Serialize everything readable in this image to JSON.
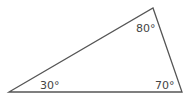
{
  "diagram": {
    "type": "triangle",
    "stroke_color": "#555555",
    "vertices": {
      "bottom_left": {
        "x": 9,
        "y": 92
      },
      "top": {
        "x": 153,
        "y": 8
      },
      "bottom_right": {
        "x": 182,
        "y": 92
      }
    },
    "angles": [
      {
        "vertex": "bottom_left",
        "label": "30°"
      },
      {
        "vertex": "top",
        "label": "80°"
      },
      {
        "vertex": "bottom_right",
        "label": "70°"
      }
    ]
  }
}
